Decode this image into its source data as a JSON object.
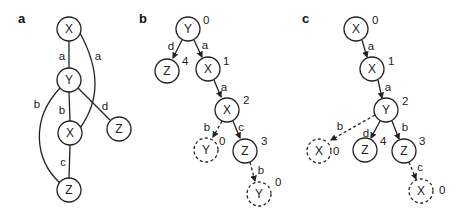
{
  "panels": {
    "a": {
      "label": "a",
      "nodes": [
        {
          "id": "X",
          "label": "X"
        },
        {
          "id": "Y",
          "label": "Y"
        },
        {
          "id": "X2",
          "label": "X"
        },
        {
          "id": "Zr",
          "label": "Z"
        },
        {
          "id": "Zb",
          "label": "Z"
        }
      ],
      "edges": [
        {
          "from": "X",
          "to": "Y",
          "label": "a"
        },
        {
          "from": "X",
          "to": "X2",
          "label": "a"
        },
        {
          "from": "Y",
          "to": "X2",
          "label": "b"
        },
        {
          "from": "Y",
          "to": "Zb",
          "label": "b"
        },
        {
          "from": "Y",
          "to": "Zr",
          "label": "d"
        },
        {
          "from": "X2",
          "to": "Zb",
          "label": "c"
        }
      ]
    },
    "b": {
      "label": "b",
      "nodes": [
        {
          "id": "Y0",
          "label": "Y",
          "index": "0"
        },
        {
          "id": "Z4",
          "label": "Z",
          "index": "4"
        },
        {
          "id": "X1",
          "label": "X",
          "index": "1"
        },
        {
          "id": "X2",
          "label": "X",
          "index": "2"
        },
        {
          "id": "Yd1",
          "label": "Y",
          "index": "0",
          "dashed": true
        },
        {
          "id": "Z3",
          "label": "Z",
          "index": "3"
        },
        {
          "id": "Yd2",
          "label": "Y",
          "index": "0",
          "dashed": true
        }
      ],
      "edges": [
        {
          "from": "Y0",
          "to": "Z4",
          "label": "d"
        },
        {
          "from": "Y0",
          "to": "X1",
          "label": "a"
        },
        {
          "from": "X1",
          "to": "X2",
          "label": "a"
        },
        {
          "from": "X2",
          "to": "Yd1",
          "label": "b",
          "dashed": true
        },
        {
          "from": "X2",
          "to": "Z3",
          "label": "c"
        },
        {
          "from": "Z3",
          "to": "Yd2",
          "label": "b",
          "dashed": true
        }
      ]
    },
    "c": {
      "label": "c",
      "nodes": [
        {
          "id": "X0",
          "label": "X",
          "index": "0"
        },
        {
          "id": "X1",
          "label": "X",
          "index": "1"
        },
        {
          "id": "Y2",
          "label": "Y",
          "index": "2"
        },
        {
          "id": "Xd1",
          "label": "X",
          "index": "0",
          "dashed": true
        },
        {
          "id": "Z4",
          "label": "Z",
          "index": "4"
        },
        {
          "id": "Z3",
          "label": "Z",
          "index": "3"
        },
        {
          "id": "Xd2",
          "label": "X",
          "index": "0",
          "dashed": true
        }
      ],
      "edges": [
        {
          "from": "X0",
          "to": "X1",
          "label": "a"
        },
        {
          "from": "X1",
          "to": "Y2",
          "label": "a"
        },
        {
          "from": "Y2",
          "to": "Xd1",
          "label": "b",
          "dashed": true
        },
        {
          "from": "Y2",
          "to": "Z4",
          "label": "d"
        },
        {
          "from": "Y2",
          "to": "Z3",
          "label": "b"
        },
        {
          "from": "Z3",
          "to": "Xd2",
          "label": "c",
          "dashed": true
        }
      ]
    }
  }
}
